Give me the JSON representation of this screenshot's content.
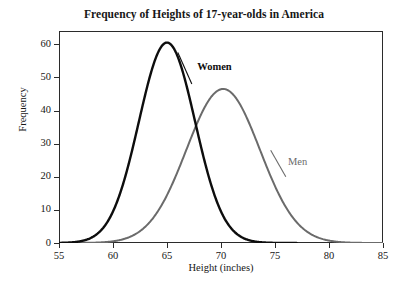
{
  "chart_data": {
    "type": "line",
    "title": "Frequency of Heights of 17-year-olds in America",
    "xlabel": "Height (inches)",
    "ylabel": "Frequency",
    "xlim": [
      55,
      85
    ],
    "ylim": [
      0,
      64
    ],
    "grid": false,
    "legend_position": "inline-annotations",
    "xticks": [
      55,
      60,
      65,
      70,
      75,
      80,
      85
    ],
    "yticks": [
      0,
      10,
      20,
      30,
      40,
      50,
      60
    ],
    "xtick_labels": [
      "55",
      "60",
      "65",
      "70",
      "75",
      "80",
      "85"
    ],
    "ytick_labels": [
      "0",
      "10",
      "20",
      "30",
      "40",
      "50",
      "60"
    ],
    "series": [
      {
        "name": "Women",
        "color": "#0d0d0d",
        "distribution": "normal",
        "peak_x": 65.0,
        "peak_y": 60.5,
        "sigma": 2.6,
        "x_start": 55.0,
        "x_end": 77.0,
        "x": [
          55,
          56,
          57,
          58,
          59,
          60,
          61,
          62,
          63,
          64,
          65,
          66,
          67,
          68,
          69,
          70,
          71,
          72,
          73,
          74,
          75,
          76,
          77
        ],
        "values": [
          0.1,
          0.5,
          1.6,
          4.1,
          8.9,
          16.5,
          26.3,
          36.5,
          47.3,
          56.1,
          60.5,
          56.1,
          47.3,
          36.5,
          26.3,
          16.5,
          8.9,
          4.1,
          1.6,
          0.5,
          0.2,
          0.1,
          0.0
        ]
      },
      {
        "name": "Men",
        "color": "#6b6b6b",
        "distribution": "normal",
        "peak_x": 70.2,
        "peak_y": 46.5,
        "sigma": 3.4,
        "x_start": 55.0,
        "x_end": 85.0,
        "x": [
          55,
          56,
          57,
          58,
          59,
          60,
          61,
          62,
          63,
          64,
          65,
          66,
          67,
          68,
          69,
          70,
          71,
          72,
          73,
          74,
          75,
          76,
          77,
          78,
          79,
          80,
          81,
          82,
          83,
          84,
          85
        ],
        "values": [
          0.2,
          0.4,
          0.8,
          1.5,
          2.7,
          4.5,
          7.2,
          10.9,
          15.6,
          21.3,
          27.6,
          34.0,
          39.8,
          44.2,
          46.4,
          46.5,
          44.4,
          40.3,
          35.0,
          28.9,
          22.7,
          17.0,
          12.1,
          8.2,
          5.3,
          3.2,
          1.9,
          1.0,
          0.5,
          0.3,
          0.1
        ]
      }
    ],
    "annotations": [
      {
        "text": "Women",
        "series": "Women",
        "x": 67.8,
        "y": 53.0
      },
      {
        "text": "Men",
        "series": "Men",
        "x": 76.2,
        "y": 24.5
      }
    ]
  }
}
